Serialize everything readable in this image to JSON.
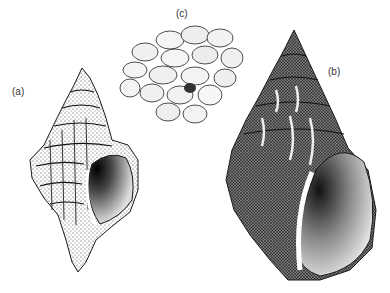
{
  "figure": {
    "labels": {
      "a": "(a)",
      "b": "(b)",
      "c": "(c)"
    },
    "colors": {
      "ink": "#1a1a1a",
      "shade": "#555555",
      "paper": "#ffffff"
    }
  }
}
